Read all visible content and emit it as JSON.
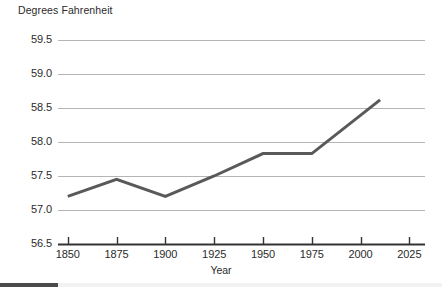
{
  "chart_data": {
    "type": "line",
    "title": "",
    "ylabel": "Degrees Fahrenheit",
    "xlabel": "Year",
    "x": [
      1850,
      1875,
      1900,
      1925,
      1950,
      1975,
      2010
    ],
    "values": [
      57.2,
      57.45,
      57.2,
      57.5,
      57.83,
      57.83,
      58.62
    ],
    "series": [
      {
        "name": "Global average temperature",
        "values": [
          57.2,
          57.45,
          57.2,
          57.5,
          57.83,
          57.83,
          58.62
        ]
      }
    ],
    "ylim": [
      56.5,
      59.5
    ],
    "xlim": [
      1845,
      2033
    ],
    "ytick_values": [
      59.5,
      59.0,
      58.5,
      58.0,
      57.5,
      57.0,
      56.5
    ],
    "ytick_labels": [
      "59.5",
      "59.0",
      "58.5",
      "58.0",
      "57.5",
      "57.0",
      "56.5"
    ],
    "xtick_values": [
      1850,
      1875,
      1900,
      1925,
      1950,
      1975,
      2000,
      2025
    ],
    "xtick_labels": [
      "1850",
      "1875",
      "1900",
      "1925",
      "1950",
      "1975",
      "2000",
      "2025"
    ],
    "grid": true,
    "grid_axis": "y",
    "legend": false,
    "legend_position": "none",
    "line_color": "#595959",
    "grid_color": "#b5b5b5",
    "axis_color": "#333333",
    "background_color": "#ffffff",
    "text_color": "#2b2b2b"
  }
}
